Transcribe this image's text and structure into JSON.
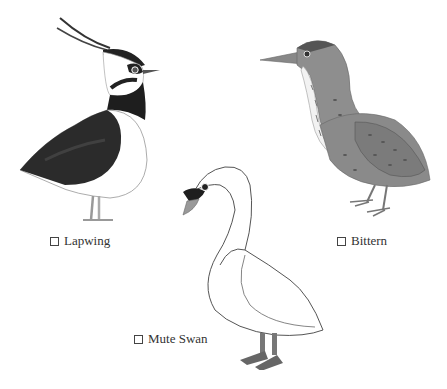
{
  "options": [
    {
      "id": "lapwing",
      "label": "Lapwing",
      "checked": false
    },
    {
      "id": "bittern",
      "label": "Bittern",
      "checked": false
    },
    {
      "id": "mute-swan",
      "label": "Mute Swan",
      "checked": false
    }
  ],
  "icons": {
    "checkbox": "checkbox-icon"
  },
  "colors": {
    "background": "#ffffff",
    "text": "#333333",
    "lapwing_dark": "#2a2a2a",
    "bittern_body": "#8a8a8a",
    "swan_outline": "#555555"
  }
}
